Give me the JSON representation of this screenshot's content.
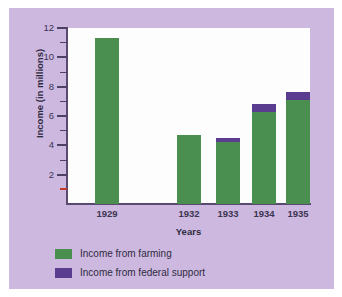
{
  "chart_data": {
    "type": "bar",
    "title": "",
    "subtitle": "",
    "xlabel": "Years",
    "ylabel": "Income (in millions)",
    "categories": [
      "1929",
      "1932",
      "1933",
      "1934",
      "1935"
    ],
    "series": [
      {
        "name": "Income from farming",
        "color": "#4a8f4f",
        "values": [
          11.3,
          4.7,
          4.2,
          6.3,
          7.1
        ]
      },
      {
        "name": "Income from federal support",
        "color": "#5b3d8f",
        "values": [
          0,
          0,
          0.3,
          0.5,
          0.55
        ]
      }
    ],
    "totals": [
      11.3,
      4.7,
      4.5,
      6.8,
      7.65
    ],
    "stacked": true,
    "ylim": [
      0,
      12
    ],
    "y_major_ticks": [
      2,
      4,
      6,
      8,
      10,
      12
    ],
    "y_minor_ticks": [
      1,
      3,
      5,
      7,
      9,
      11
    ],
    "y_tick_labels": [
      "2",
      "4",
      "6",
      "8",
      "10",
      "12"
    ],
    "grid": false,
    "legend_position": "bottom-left",
    "note": "gap in category axis between 1929 and 1932"
  },
  "axes": {
    "y_title": "Income (in millions)",
    "x_title": "Years",
    "y_labels": [
      "12",
      "10",
      "8",
      "6",
      "4",
      "2"
    ],
    "x_labels": [
      "1929",
      "1932",
      "1933",
      "1934",
      "1935"
    ]
  },
  "legend": {
    "items": [
      {
        "label": "Income from farming",
        "color": "#4a8f4f"
      },
      {
        "label": "Income from federal support",
        "color": "#5b3d8f"
      }
    ]
  },
  "colors": {
    "background": "#cdb8e0",
    "plot_area": "#fdfdfd",
    "axis": "#5a4a72",
    "farming": "#4a8f4f",
    "federal": "#5b3d8f",
    "red_tick": "#c0392b"
  }
}
